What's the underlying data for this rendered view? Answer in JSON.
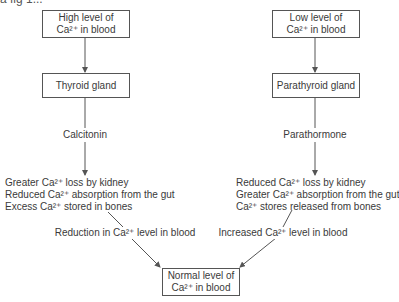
{
  "top_fragment": "a fig 1...",
  "nodes": {
    "high": {
      "line1": "High level of",
      "line2": "Ca²⁺ in blood"
    },
    "low": {
      "line1": "Low level of",
      "line2": "Ca²⁺ in blood"
    },
    "thyroid": {
      "label": "Thyroid gland"
    },
    "parathyroid": {
      "label": "Parathyroid gland"
    },
    "calcitonin": {
      "label": "Calcitonin"
    },
    "parathormone": {
      "label": "Parathormone"
    },
    "left_effects": [
      "Greater Ca²⁺ loss by kidney",
      "Reduced Ca²⁺ absorption from the gut",
      "Excess Ca²⁺ stored in bones"
    ],
    "right_effects": [
      "Reduced Ca²⁺ loss by kidney",
      "Greater Ca²⁺ absorption from the gut",
      "Ca²⁺ stores released from bones"
    ],
    "reduction": {
      "label": "Reduction in Ca²⁺ level in blood"
    },
    "increased": {
      "label": "Increased Ca²⁺ level in blood"
    },
    "normal": {
      "line1": "Normal level of",
      "line2": "Ca²⁺ in blood"
    }
  },
  "colors": {
    "line": "#555555",
    "text": "#3a3a3a"
  }
}
